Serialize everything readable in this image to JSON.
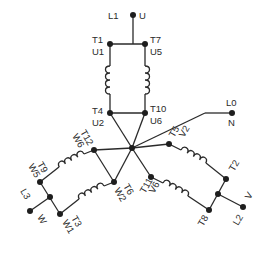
{
  "diagram": {
    "colors": {
      "line": "#2a2a2a",
      "terminal": "#1e1e1e",
      "background": "#ffffff"
    },
    "labels": {
      "l1": "L1",
      "u": "U",
      "t1": "T1",
      "u1": "U1",
      "t7": "T7",
      "u5": "U5",
      "t4": "T4",
      "u2": "U2",
      "t10": "T10",
      "u6": "U6",
      "l0": "L0",
      "n": "N",
      "t5": "T5",
      "v2": "V2",
      "t2": "T2",
      "t11": "T11",
      "v6": "V6",
      "t8": "T8",
      "l2": "L2",
      "v": "V",
      "t12": "T12",
      "w6": "W6",
      "t9": "T9",
      "w5": "W5",
      "t6": "T6",
      "w2": "W2",
      "t3": "T3",
      "w1": "W1",
      "l3": "L3",
      "w": "W"
    },
    "phases": [
      {
        "name": "U",
        "line": "L1",
        "coils": [
          [
            "T1",
            "T4"
          ],
          [
            "T7",
            "T10"
          ]
        ]
      },
      {
        "name": "V",
        "line": "L2",
        "coils": [
          [
            "T5",
            "T2"
          ],
          [
            "T11",
            "T8"
          ]
        ]
      },
      {
        "name": "W",
        "line": "L3",
        "coils": [
          [
            "T12",
            "T9"
          ],
          [
            "T6",
            "T3"
          ]
        ]
      }
    ],
    "neutral": {
      "line": "L0",
      "label": "N"
    }
  }
}
